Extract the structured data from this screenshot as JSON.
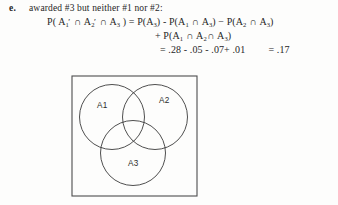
{
  "problem": {
    "item_label": "e.",
    "prompt": "awarded #3 but neither #1 nor #2:",
    "equation_line_1": "P( A₁′ ∩ A₂′ ∩ A₃ ) = P(A₃) - P(A₁ ∩ A₃) − P(A₂ ∩ A₃)",
    "equation_line_2": "+ P(A₁ ∩ A₂ ∩ A₃)",
    "equation_line_3": "= .28 - .05 - .07+ .01      = .17",
    "terms": {
      "lhs": "P( A₁′ ∩ A₂′ ∩ A₃ )",
      "rhs_first": "P(A₃)",
      "rhs_second": "P(A₁ ∩ A₃)",
      "rhs_third": "P(A₂ ∩ A₃)",
      "rhs_fourth": "P(A₁ ∩ A₂ ∩ A₃)"
    },
    "values": {
      "p_a3": ".28",
      "p_a1_a3": ".05",
      "p_a2_a3": ".07",
      "p_a1_a2_a3": ".01",
      "result": ".17"
    }
  },
  "figure": {
    "type": "venn-diagram",
    "set_count": 3,
    "labels": {
      "set_1": "A1",
      "set_2": "A2",
      "set_3": "A3"
    },
    "colors": {
      "stroke": "#3a3a3a",
      "box_stroke": "#4a4a4a",
      "fill": "none"
    }
  }
}
